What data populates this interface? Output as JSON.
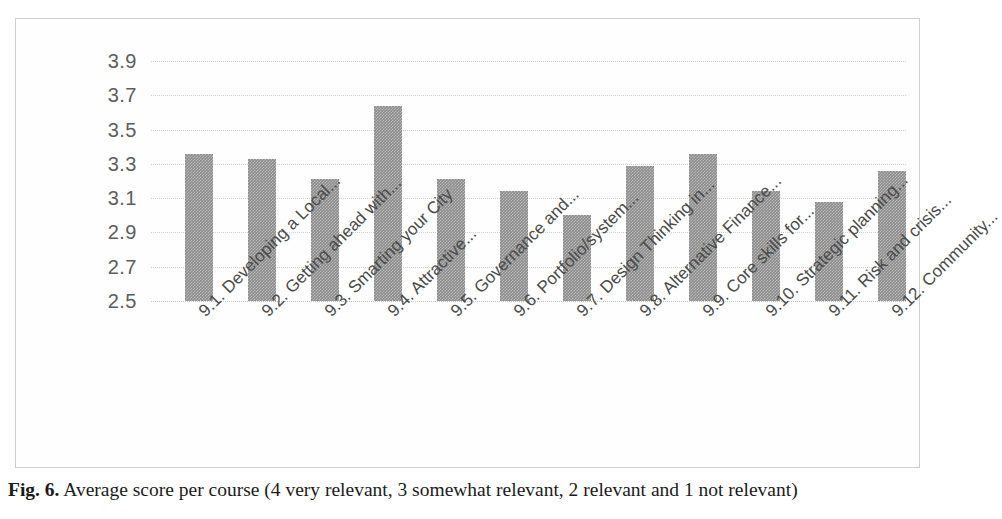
{
  "figure": {
    "caption_label": "Fig. 6.",
    "caption_text": "Average score per course (4 very relevant, 3 somewhat relevant, 2 relevant and 1 not relevant)"
  },
  "chart_data": {
    "type": "bar",
    "title": "",
    "xlabel": "",
    "ylabel": "",
    "ylim": [
      2.5,
      3.9
    ],
    "yticks": [
      "3.9",
      "3.7",
      "3.5",
      "3.3",
      "3.1",
      "2.9",
      "2.7",
      "2.5"
    ],
    "grid": true,
    "legend": false,
    "bar_color": "#8c8c8c",
    "categories": [
      "9.1. Developing a Local...",
      "9.2. Getting ahead with...",
      "9.3. Smarting your City",
      "9.4. Attractive...",
      "9.5. Governance and...",
      "9.6. Portfolio/system...",
      "9.7. Design Thinking in...",
      "9.8. Alternative Finance...",
      "9.9. Core skills for...",
      "9.10. Strategic planning...",
      "9.11. Risk and crisis...",
      "9.12. Community..."
    ],
    "values": [
      3.36,
      3.33,
      3.21,
      3.64,
      3.21,
      3.14,
      3.0,
      3.29,
      3.36,
      3.14,
      3.08,
      3.26
    ]
  }
}
